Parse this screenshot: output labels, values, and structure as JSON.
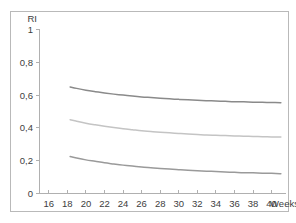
{
  "figure": {
    "background_color": "#ffffff",
    "frame_color": "#b9b9b9",
    "axis_color": "#b0b0b0",
    "text_color": "#3d3d3d"
  },
  "chart_data": {
    "type": "line",
    "title": "",
    "subtitle": "",
    "xlabel": "Weeks",
    "ylabel": "RI",
    "ylabel_position": "top-left-above-axis",
    "xlabel_position": "right-end-of-axis",
    "grid": false,
    "legend": null,
    "xlim": [
      15.0,
      41.5
    ],
    "ylim": [
      0,
      1
    ],
    "xticks": [
      16,
      18,
      20,
      22,
      24,
      26,
      28,
      30,
      32,
      34,
      36,
      38,
      40
    ],
    "xtick_labels": [
      "16",
      "18",
      "20",
      "22",
      "24",
      "26",
      "28",
      "30",
      "32",
      "34",
      "36",
      "38",
      "40"
    ],
    "yticks": [
      0,
      0.2,
      0.4,
      0.6,
      0.8,
      1
    ],
    "ytick_labels": [
      "0",
      "0,2",
      "0,4",
      "0,6",
      "0,8",
      "1"
    ],
    "decimal_separator": ",",
    "x": [
      18.3,
      19,
      20,
      21,
      22,
      23,
      24,
      25,
      26,
      27,
      28,
      29,
      30,
      31,
      32,
      33,
      34,
      35,
      36,
      37,
      38,
      39,
      40,
      41
    ],
    "series": [
      {
        "name": "upper-curve",
        "color": "#8a8a8a",
        "values": [
          0.65,
          0.641,
          0.63,
          0.621,
          0.613,
          0.606,
          0.6,
          0.594,
          0.589,
          0.585,
          0.581,
          0.577,
          0.574,
          0.571,
          0.568,
          0.566,
          0.564,
          0.562,
          0.56,
          0.559,
          0.557,
          0.556,
          0.555,
          0.554
        ]
      },
      {
        "name": "middle-curve",
        "color": "#c4c4c4",
        "values": [
          0.45,
          0.441,
          0.429,
          0.419,
          0.41,
          0.402,
          0.395,
          0.389,
          0.383,
          0.378,
          0.374,
          0.37,
          0.366,
          0.363,
          0.36,
          0.357,
          0.355,
          0.353,
          0.351,
          0.349,
          0.348,
          0.346,
          0.345,
          0.344
        ]
      },
      {
        "name": "lower-curve",
        "color": "#9a9a9a",
        "values": [
          0.225,
          0.216,
          0.205,
          0.196,
          0.187,
          0.18,
          0.173,
          0.167,
          0.162,
          0.157,
          0.153,
          0.149,
          0.145,
          0.142,
          0.139,
          0.136,
          0.134,
          0.131,
          0.129,
          0.127,
          0.126,
          0.124,
          0.123,
          0.121
        ]
      }
    ]
  }
}
